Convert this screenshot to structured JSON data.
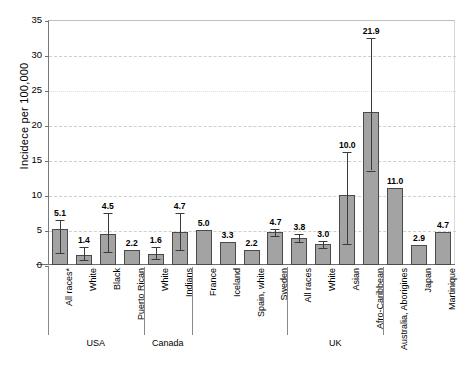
{
  "chart_data": {
    "type": "bar",
    "title": "",
    "xlabel": "",
    "ylabel": "Incidece per 100,000",
    "ylim": [
      0,
      35
    ],
    "yticks": [
      0,
      5,
      10,
      15,
      20,
      25,
      30,
      35
    ],
    "grid": "horizontal dashed gridlines at 10, 15, 20, 25, 30",
    "legend": "none",
    "bar_color": "#a3a3a3",
    "bar_edge_color": "#4a4a4a",
    "categories": [
      "All races*",
      "White",
      "Black",
      "Puerto Rican",
      "White",
      "Indians",
      "France",
      "Iceland",
      "Spain, white",
      "Sweden",
      "All races",
      "White",
      "Asian",
      "Afro-Caribbean",
      "Australia, Aborigines",
      "Japan",
      "Martinique"
    ],
    "values": [
      5.1,
      1.4,
      4.5,
      2.2,
      1.6,
      4.7,
      5.0,
      3.3,
      2.2,
      4.7,
      3.8,
      3.0,
      10.0,
      21.9,
      11.0,
      2.9,
      4.7
    ],
    "value_labels": [
      "5.1",
      "1.4",
      "4.5",
      "2.2",
      "1.6",
      "4.7",
      "5.0",
      "3.3",
      "2.2",
      "4.7",
      "3.8",
      "3.0",
      "10.0",
      "21.9",
      "11.0",
      "2.9",
      "4.7"
    ],
    "error_bars": [
      {
        "index": 0,
        "low": 1.7,
        "high": 6.5
      },
      {
        "index": 1,
        "low": 0.7,
        "high": 2.6
      },
      {
        "index": 2,
        "low": 1.8,
        "high": 7.4
      },
      {
        "index": 4,
        "low": 0.9,
        "high": 2.6
      },
      {
        "index": 5,
        "low": 2.1,
        "high": 7.4
      },
      {
        "index": 9,
        "low": 4.2,
        "high": 5.2
      },
      {
        "index": 10,
        "low": 3.3,
        "high": 4.4
      },
      {
        "index": 11,
        "low": 2.5,
        "high": 3.5
      },
      {
        "index": 12,
        "low": 3.0,
        "high": 16.1
      },
      {
        "index": 13,
        "low": 13.5,
        "high": 32.4
      }
    ],
    "groups": [
      {
        "label": "USA",
        "from": 0,
        "to": 3
      },
      {
        "label": "Canada",
        "from": 4,
        "to": 5
      },
      {
        "label": "UK",
        "from": 10,
        "to": 13
      }
    ]
  }
}
